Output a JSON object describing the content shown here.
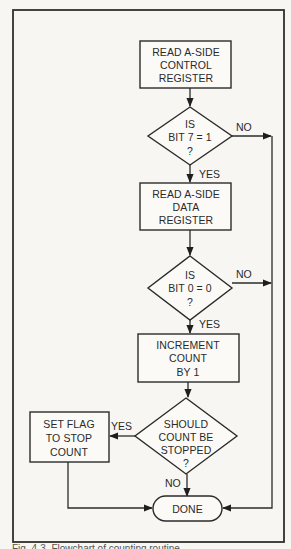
{
  "diagram": {
    "type": "flowchart",
    "nodes": {
      "read_control": {
        "shape": "process",
        "lines": [
          "READ A-SIDE",
          "CONTROL",
          "REGISTER"
        ]
      },
      "check_bit7": {
        "shape": "decision",
        "lines": [
          "IS",
          "BIT 7 = 1",
          "?"
        ]
      },
      "read_data": {
        "shape": "process",
        "lines": [
          "READ A-SIDE",
          "DATA",
          "REGISTER"
        ]
      },
      "check_bit0": {
        "shape": "decision",
        "lines": [
          "IS",
          "BIT 0 = 0",
          "?"
        ]
      },
      "increment": {
        "shape": "process",
        "lines": [
          "INCREMENT",
          "COUNT",
          "BY 1"
        ]
      },
      "should_stop": {
        "shape": "decision",
        "lines": [
          "SHOULD",
          "COUNT BE",
          "STOPPED",
          "?"
        ]
      },
      "set_flag": {
        "shape": "process",
        "lines": [
          "SET FLAG",
          "TO STOP",
          "COUNT"
        ]
      },
      "done": {
        "shape": "terminal",
        "lines": [
          "DONE"
        ]
      }
    },
    "edges": [
      {
        "from": "read_control",
        "to": "check_bit7",
        "label": ""
      },
      {
        "from": "check_bit7",
        "to": "read_data",
        "label": "YES"
      },
      {
        "from": "check_bit7",
        "to": "done",
        "label": "NO"
      },
      {
        "from": "read_data",
        "to": "check_bit0",
        "label": ""
      },
      {
        "from": "check_bit0",
        "to": "increment",
        "label": "YES"
      },
      {
        "from": "check_bit0",
        "to": "done",
        "label": "NO"
      },
      {
        "from": "increment",
        "to": "should_stop",
        "label": ""
      },
      {
        "from": "should_stop",
        "to": "set_flag",
        "label": "YES"
      },
      {
        "from": "should_stop",
        "to": "done",
        "label": "NO"
      },
      {
        "from": "set_flag",
        "to": "done",
        "label": ""
      }
    ],
    "labels": {
      "yes": "YES",
      "no": "NO"
    }
  },
  "caption": "Fig. 4-3. Flowchart of counting routine"
}
